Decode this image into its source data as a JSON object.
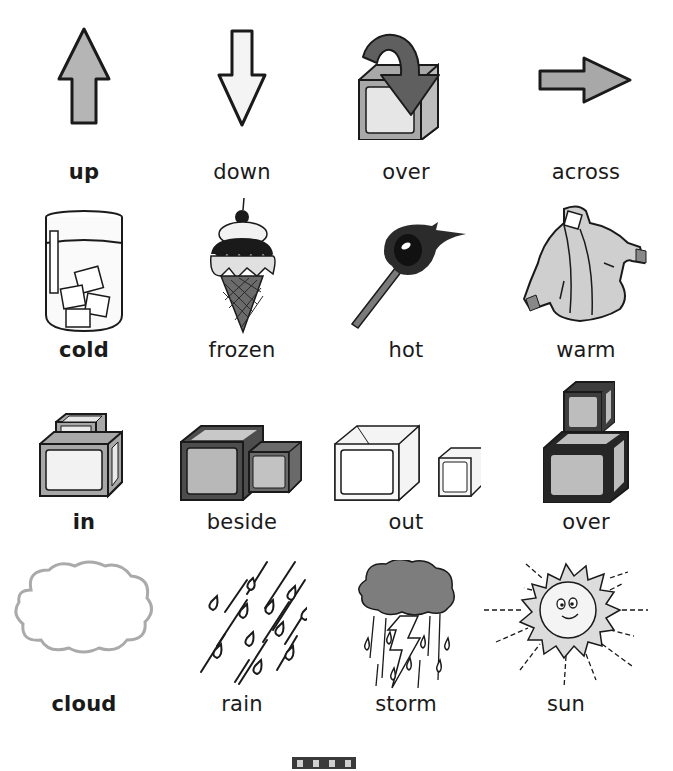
{
  "worksheet": {
    "rows": [
      {
        "cells": [
          {
            "word": "up",
            "bold": true,
            "icon": "up-arrow-icon"
          },
          {
            "word": "down",
            "bold": false,
            "icon": "down-arrow-icon"
          },
          {
            "word": "over",
            "bold": false,
            "icon": "curved-arrow-over-box-icon"
          },
          {
            "word": "across",
            "bold": false,
            "icon": "right-arrow-icon"
          }
        ]
      },
      {
        "cells": [
          {
            "word": "cold",
            "bold": true,
            "icon": "glass-of-ice-icon"
          },
          {
            "word": "frozen",
            "bold": false,
            "icon": "ice-cream-cone-icon"
          },
          {
            "word": "hot",
            "bold": false,
            "icon": "burning-match-icon"
          },
          {
            "word": "warm",
            "bold": false,
            "icon": "winter-jacket-icon"
          }
        ]
      },
      {
        "cells": [
          {
            "word": "in",
            "bold": true,
            "icon": "box-in-box-icon"
          },
          {
            "word": "beside",
            "bold": false,
            "icon": "box-beside-box-icon"
          },
          {
            "word": "out",
            "bold": false,
            "icon": "box-out-of-box-icon"
          },
          {
            "word": "over",
            "bold": false,
            "icon": "box-over-box-icon"
          }
        ]
      },
      {
        "cells": [
          {
            "word": "cloud",
            "bold": true,
            "icon": "cloud-icon"
          },
          {
            "word": "rain",
            "bold": false,
            "icon": "rain-icon"
          },
          {
            "word": "storm",
            "bold": false,
            "icon": "storm-cloud-icon"
          },
          {
            "word": "sun",
            "bold": false,
            "icon": "smiling-sun-icon"
          }
        ]
      }
    ]
  },
  "colors": {
    "outline": "#1a1a1a",
    "mid_gray": "#a8a8a8",
    "light_gray": "#e4e4e4",
    "dark_gray": "#595959"
  }
}
